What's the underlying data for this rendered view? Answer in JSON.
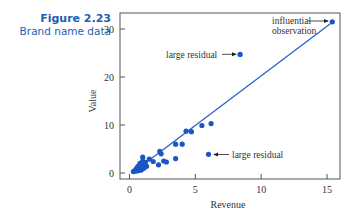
{
  "figure": {
    "number": "Figure 2.23",
    "title": "Brand name data"
  },
  "chart_data": {
    "type": "scatter",
    "title": "",
    "xlabel": "Revenue",
    "ylabel": "Value",
    "xlim": [
      -0.5,
      16
    ],
    "ylim": [
      -1,
      33
    ],
    "x_ticks": [
      0,
      5,
      10,
      15
    ],
    "y_ticks": [
      0,
      10,
      20,
      30
    ],
    "grid": false,
    "point_color": "#1a56c4",
    "line_color": "#2a62c4",
    "regression_line": {
      "x0": 0.3,
      "y0": 0.2,
      "x1": 15.4,
      "y1": 31.5
    },
    "points": [
      {
        "x": 0.3,
        "y": 0.3
      },
      {
        "x": 0.4,
        "y": 0.5
      },
      {
        "x": 0.5,
        "y": 0.4
      },
      {
        "x": 0.5,
        "y": 0.8
      },
      {
        "x": 0.6,
        "y": 0.6
      },
      {
        "x": 0.6,
        "y": 1.2
      },
      {
        "x": 0.7,
        "y": 0.5
      },
      {
        "x": 0.7,
        "y": 1.5
      },
      {
        "x": 0.8,
        "y": 1.0
      },
      {
        "x": 0.8,
        "y": 2.0
      },
      {
        "x": 0.9,
        "y": 0.6
      },
      {
        "x": 0.9,
        "y": 1.4
      },
      {
        "x": 1.0,
        "y": 2.5
      },
      {
        "x": 1.0,
        "y": 3.3
      },
      {
        "x": 1.1,
        "y": 1.0
      },
      {
        "x": 1.1,
        "y": 1.8
      },
      {
        "x": 1.2,
        "y": 2.2
      },
      {
        "x": 1.3,
        "y": 1.4
      },
      {
        "x": 1.5,
        "y": 2.9
      },
      {
        "x": 1.8,
        "y": 2.4
      },
      {
        "x": 2.2,
        "y": 1.7
      },
      {
        "x": 2.3,
        "y": 4.5
      },
      {
        "x": 2.4,
        "y": 4.0
      },
      {
        "x": 2.6,
        "y": 2.5
      },
      {
        "x": 2.8,
        "y": 2.3
      },
      {
        "x": 3.5,
        "y": 3.0
      },
      {
        "x": 3.5,
        "y": 6.0
      },
      {
        "x": 4.0,
        "y": 6.0
      },
      {
        "x": 4.3,
        "y": 8.7
      },
      {
        "x": 4.7,
        "y": 8.6
      },
      {
        "x": 5.5,
        "y": 9.9
      },
      {
        "x": 6.2,
        "y": 10.3
      },
      {
        "x": 6.0,
        "y": 3.9
      },
      {
        "x": 8.4,
        "y": 24.7
      },
      {
        "x": 15.4,
        "y": 31.5
      }
    ],
    "annotations": [
      {
        "text": "influential",
        "text2": "observation",
        "target": {
          "x": 15.4,
          "y": 31.5
        }
      },
      {
        "text": "large residual",
        "target": {
          "x": 8.4,
          "y": 24.7
        }
      },
      {
        "text": "large residual",
        "target": {
          "x": 6.0,
          "y": 3.9
        }
      }
    ]
  },
  "labels": {
    "x_axis": "Revenue",
    "y_axis": "Value",
    "xt0": "0",
    "xt1": "5",
    "xt2": "10",
    "xt3": "15",
    "yt0": "0",
    "yt1": "10",
    "yt2": "20",
    "yt3": "30",
    "anno_influential_1": "influential",
    "anno_influential_2": "observation",
    "anno_residual_upper": "large residual",
    "anno_residual_lower": "large residual"
  }
}
